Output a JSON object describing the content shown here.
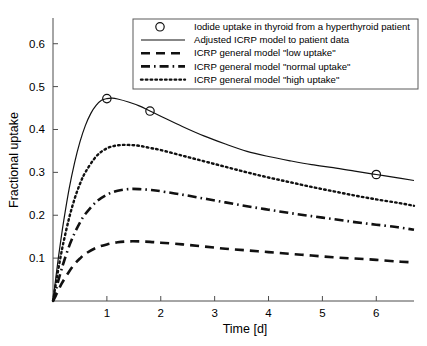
{
  "chart_data": {
    "type": "line",
    "title": "",
    "xlabel": "Time [d]",
    "ylabel": "Fractional uptake",
    "xlim": [
      0,
      6.7
    ],
    "ylim": [
      0,
      0.66
    ],
    "xticks": [
      1,
      2,
      3,
      4,
      5,
      6
    ],
    "yticks": [
      0.1,
      0.2,
      0.3,
      0.4,
      0.5,
      0.6
    ],
    "xtick_labels": [
      "1",
      "2",
      "3",
      "4",
      "5",
      "6"
    ],
    "ytick_labels": [
      "0.1",
      "0.2",
      "0.3",
      "0.4",
      "0.5",
      "0.6"
    ],
    "grid": false,
    "legend_position": "upper right",
    "series": [
      {
        "name": "Iodide uptake in thyroid from a hyperthyroid patient",
        "style": "marker-circle",
        "marker": "open-circle",
        "x": [
          1.0,
          1.8,
          6.0
        ],
        "y": [
          0.472,
          0.443,
          0.295
        ]
      },
      {
        "name": "Adjusted ICRP model to patient data",
        "style": "solid",
        "x": [
          0.0,
          0.05,
          0.1,
          0.15,
          0.2,
          0.3,
          0.4,
          0.5,
          0.6,
          0.7,
          0.8,
          0.9,
          1.0,
          1.1,
          1.2,
          1.4,
          1.6,
          1.8,
          2.0,
          2.4,
          2.8,
          3.2,
          3.6,
          4.0,
          4.4,
          4.8,
          5.2,
          5.6,
          6.0,
          6.4,
          6.7
        ],
        "y": [
          0.0,
          0.052,
          0.101,
          0.146,
          0.188,
          0.262,
          0.322,
          0.371,
          0.409,
          0.437,
          0.456,
          0.468,
          0.472,
          0.473,
          0.471,
          0.464,
          0.455,
          0.443,
          0.431,
          0.407,
          0.385,
          0.366,
          0.349,
          0.337,
          0.327,
          0.318,
          0.311,
          0.303,
          0.295,
          0.287,
          0.281
        ]
      },
      {
        "name": "ICRP general model \"low uptake\"",
        "style": "dashed",
        "x": [
          0.0,
          0.05,
          0.1,
          0.15,
          0.2,
          0.3,
          0.4,
          0.5,
          0.6,
          0.8,
          1.0,
          1.2,
          1.4,
          1.6,
          1.8,
          2.0,
          2.4,
          2.8,
          3.2,
          3.6,
          4.0,
          4.4,
          4.8,
          5.2,
          5.6,
          6.0,
          6.4,
          6.7
        ],
        "y": [
          0.0,
          0.012,
          0.025,
          0.038,
          0.049,
          0.069,
          0.086,
          0.099,
          0.11,
          0.124,
          0.132,
          0.137,
          0.139,
          0.139,
          0.138,
          0.136,
          0.132,
          0.127,
          0.122,
          0.118,
          0.114,
          0.11,
          0.106,
          0.102,
          0.099,
          0.096,
          0.092,
          0.09
        ]
      },
      {
        "name": "ICRP general model \"normal uptake\"",
        "style": "dashdot",
        "x": [
          0.0,
          0.05,
          0.1,
          0.15,
          0.2,
          0.3,
          0.4,
          0.5,
          0.6,
          0.8,
          1.0,
          1.2,
          1.4,
          1.6,
          1.8,
          2.0,
          2.4,
          2.8,
          3.2,
          3.6,
          4.0,
          4.4,
          4.8,
          5.2,
          5.6,
          6.0,
          6.4,
          6.7
        ],
        "y": [
          0.0,
          0.024,
          0.048,
          0.07,
          0.091,
          0.128,
          0.158,
          0.183,
          0.203,
          0.231,
          0.248,
          0.257,
          0.261,
          0.261,
          0.259,
          0.256,
          0.248,
          0.239,
          0.23,
          0.221,
          0.213,
          0.205,
          0.198,
          0.191,
          0.184,
          0.178,
          0.172,
          0.166
        ]
      },
      {
        "name": "ICRP general model \"high uptake\"",
        "style": "dotted",
        "x": [
          0.0,
          0.05,
          0.1,
          0.15,
          0.2,
          0.3,
          0.4,
          0.5,
          0.6,
          0.8,
          1.0,
          1.2,
          1.4,
          1.6,
          1.8,
          2.0,
          2.4,
          2.8,
          3.2,
          3.6,
          4.0,
          4.4,
          4.8,
          5.2,
          5.6,
          6.0,
          6.4,
          6.7
        ],
        "y": [
          0.0,
          0.038,
          0.075,
          0.109,
          0.14,
          0.194,
          0.238,
          0.273,
          0.3,
          0.337,
          0.356,
          0.363,
          0.364,
          0.362,
          0.357,
          0.352,
          0.339,
          0.326,
          0.313,
          0.3,
          0.288,
          0.277,
          0.266,
          0.256,
          0.246,
          0.237,
          0.229,
          0.222
        ]
      }
    ]
  },
  "legend": {
    "entries": [
      {
        "label": "Iodide uptake in thyroid from a hyperthyroid patient",
        "style": "marker-circle"
      },
      {
        "label": "Adjusted ICRP model to patient data",
        "style": "solid"
      },
      {
        "label": "ICRP general model \"low uptake\"",
        "style": "dashed"
      },
      {
        "label": "ICRP general model \"normal uptake\"",
        "style": "dashdot"
      },
      {
        "label": "ICRP general model \"high uptake\"",
        "style": "dotted"
      }
    ]
  },
  "colors": {
    "line": "#111111",
    "axis": "#4d4d4d",
    "legend_border": "#5a5a5a",
    "background": "#ffffff"
  }
}
